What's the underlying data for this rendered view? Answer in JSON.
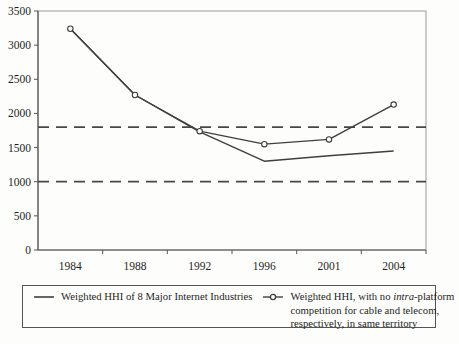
{
  "figure": {
    "background": "#fdfdfc"
  },
  "chart_data": {
    "type": "line",
    "title": "",
    "xlabel": "",
    "ylabel": "",
    "x_categories": [
      "1984",
      "1988",
      "1992",
      "1996",
      "2001",
      "2004"
    ],
    "ylim": [
      0,
      3500
    ],
    "ytick_interval": 500,
    "ytick_labels": [
      "0",
      "500",
      "1000",
      "1500",
      "2000",
      "2500",
      "3000",
      "3500"
    ],
    "grid": false,
    "legend_position": "bottom",
    "series": [
      {
        "name": "Weighted HHI of 8 Major Internet Industries",
        "marker": "none",
        "line_style": "solid",
        "color": "#3f3f3f",
        "values": [
          3240,
          2270,
          1730,
          1300,
          1380,
          1450
        ]
      },
      {
        "name": "Weighted HHI, with no intra-platform competition for cable and telecom, respectively, in same territory",
        "marker": "open-circle",
        "line_style": "solid",
        "color": "#3f3f3f",
        "values": [
          3240,
          2270,
          1740,
          1550,
          1620,
          2130
        ]
      }
    ],
    "reference_lines": [
      {
        "value": 1800,
        "style": "dashed",
        "color": "#474747"
      },
      {
        "value": 1000,
        "style": "dashed",
        "color": "#474747"
      }
    ]
  },
  "legend": {
    "entries": [
      {
        "label": "Weighted HHI of 8 Major Internet Industries"
      },
      {
        "label_prefix": "Weighted HHI, with no ",
        "label_italic": "intra",
        "label_suffix": "-platform competition for cable and telecom, respectively, in same territory"
      }
    ]
  }
}
